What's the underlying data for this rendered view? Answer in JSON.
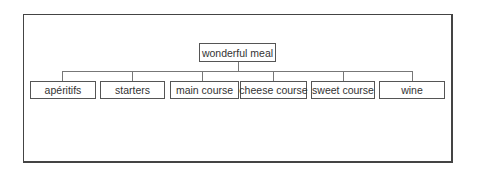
{
  "diagram": {
    "type": "tree",
    "root": {
      "label": "wonderful meal"
    },
    "children": [
      {
        "label": "apéritifs"
      },
      {
        "label": "starters"
      },
      {
        "label": "main course"
      },
      {
        "label": "cheese course"
      },
      {
        "label": "sweet course"
      },
      {
        "label": "wine"
      }
    ]
  }
}
